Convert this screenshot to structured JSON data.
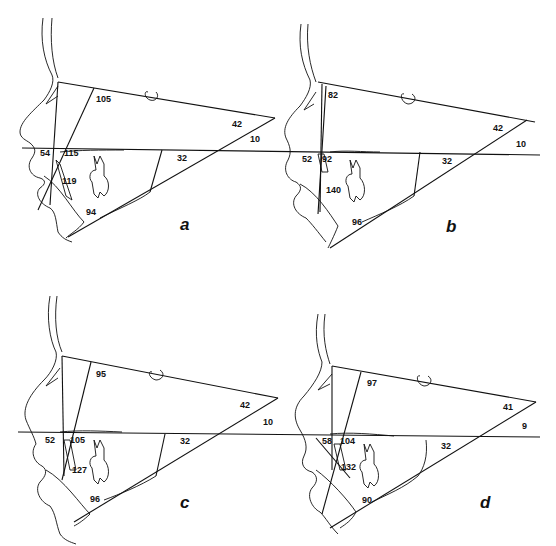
{
  "figure": {
    "panels": [
      {
        "id": "a",
        "label": "a",
        "angles": {
          "top_vertical": "105",
          "top_right": "42",
          "right_inner": "10",
          "lower_mid": "32",
          "left_upper": "54",
          "incisor_upper": "115",
          "incisor_mid": "119",
          "lower_incisor": "94"
        }
      },
      {
        "id": "b",
        "label": "b",
        "angles": {
          "top_vertical": "82",
          "top_right": "42",
          "right_inner": "10",
          "lower_mid": "32",
          "left_upper": "52",
          "incisor_upper": "92",
          "incisor_mid": "140",
          "lower_incisor": "96"
        }
      },
      {
        "id": "c",
        "label": "c",
        "angles": {
          "top_vertical": "95",
          "top_right": "42",
          "right_inner": "10",
          "lower_mid": "32",
          "left_upper": "52",
          "incisor_upper": "105",
          "incisor_mid": "127",
          "lower_incisor": "96"
        }
      },
      {
        "id": "d",
        "label": "d",
        "angles": {
          "top_vertical": "97",
          "top_right": "41",
          "right_inner": "9",
          "lower_mid": "32",
          "left_upper": "58",
          "incisor_upper": "104",
          "incisor_mid": "132",
          "lower_incisor": "90"
        }
      }
    ]
  }
}
